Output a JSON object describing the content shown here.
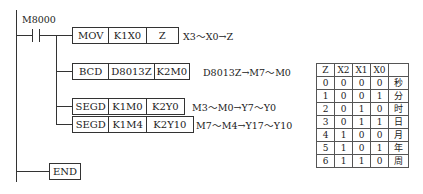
{
  "contact": {
    "label": "M8000"
  },
  "instructions": [
    {
      "op": "MOV",
      "args": [
        "K1X0",
        "Z"
      ],
      "note": "X3～X0→Z"
    },
    {
      "op": "BCD",
      "args": [
        "D8013Z",
        "K2M0"
      ],
      "note": "D8013Z→M7～M0"
    },
    {
      "op": "SEGD",
      "args": [
        "K1M0",
        "K2Y0"
      ],
      "note": "M3～M0→Y7～Y0"
    },
    {
      "op": "SEGD",
      "args": [
        "K1M4",
        "K2Y10"
      ],
      "note": "M7～M4→Y17～Y10"
    }
  ],
  "end": {
    "label": "END"
  },
  "table": {
    "headers": [
      "Z",
      "X2",
      "X1",
      "X0",
      ""
    ],
    "rows": [
      [
        "0",
        "0",
        "0",
        "0",
        "秒"
      ],
      [
        "1",
        "0",
        "0",
        "1",
        "分"
      ],
      [
        "2",
        "0",
        "1",
        "0",
        "时"
      ],
      [
        "3",
        "0",
        "1",
        "1",
        "日"
      ],
      [
        "4",
        "1",
        "0",
        "0",
        "月"
      ],
      [
        "5",
        "1",
        "0",
        "1",
        "年"
      ],
      [
        "6",
        "1",
        "1",
        "0",
        "周"
      ]
    ]
  }
}
